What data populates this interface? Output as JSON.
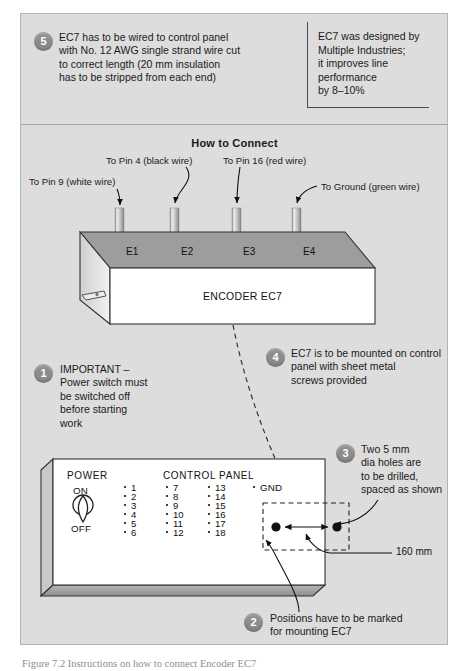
{
  "figure": {
    "section_heading": "How to Connect",
    "caption": "Figure 7.2  Instructions on how to connect Encoder EC7"
  },
  "side_note": {
    "lines": [
      "EC7 was designed by",
      "Multiple Industries;",
      "it improves line",
      "performance",
      "by 8–10%"
    ]
  },
  "steps": [
    {
      "number": "1",
      "lines": [
        "IMPORTANT –",
        "Power switch must",
        "be switched off",
        "before starting",
        "work"
      ]
    },
    {
      "number": "2",
      "lines": [
        "Positions have to be marked",
        "for mounting EC7"
      ]
    },
    {
      "number": "3",
      "lines": [
        "Two 5 mm",
        "dia holes are",
        "to be drilled,",
        "spaced as shown"
      ]
    },
    {
      "number": "4",
      "lines": [
        "EC7 is to be mounted on control",
        "panel with sheet metal",
        "screws provided"
      ]
    },
    {
      "number": "5",
      "lines": [
        "EC7 has to be wired to control panel",
        "with No. 12 AWG single strand wire cut",
        "to correct length (20 mm insulation",
        "has to be stripped from each end)"
      ]
    }
  ],
  "encoder": {
    "title": "ENCODER EC7",
    "terminals": [
      "E1",
      "E2",
      "E3",
      "E4"
    ],
    "wire_callouts": [
      "To Pin 9 (white wire)",
      "To Pin 4 (black wire)",
      "To Pin 16 (red wire)",
      "To Ground (green wire)"
    ]
  },
  "control_panel": {
    "power_label": "POWER",
    "title": "CONTROL PANEL",
    "switch_on": "ON",
    "switch_off": "OFF",
    "ground_label": "GND",
    "pin_columns": [
      [
        "1",
        "2",
        "3",
        "4",
        "5",
        "6"
      ],
      [
        "7",
        "8",
        "9",
        "10",
        "11",
        "12"
      ],
      [
        "13",
        "14",
        "15",
        "16",
        "17",
        "18"
      ]
    ]
  },
  "dimension": {
    "hole_spacing": "160 mm"
  },
  "colors": {
    "frame_bg": "#dedede",
    "frame_border": "#b4b4b4",
    "badge": "#8c8c8c",
    "encoder_top": "#999999",
    "encoder_face": "#ffffff",
    "panel_face": "#ffffff",
    "panel_edge": "#9d9d9d",
    "ink": "#1a1a1a"
  }
}
